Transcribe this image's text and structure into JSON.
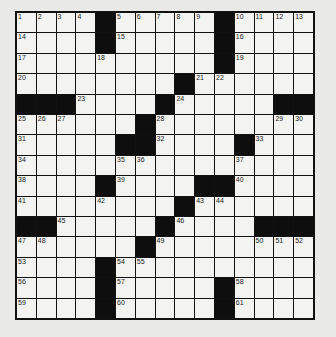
{
  "puzzle": {
    "rows": 15,
    "cols": 15,
    "grid": [
      "....#.....#....",
      "....#.....#....",
      "..........#....",
      "........#......",
      "###....#.....##",
      "......#......  ",
      ".....##....#...",
      "...............",
      "....#....##....",
      "........#......",
      "##.....#....###",
      "......#........",
      "....#..........",
      "....#.....#....",
      "....#.....#...."
    ],
    "numbers": [
      {
        "r": 0,
        "c": 0,
        "n": "1"
      },
      {
        "r": 0,
        "c": 1,
        "n": "2"
      },
      {
        "r": 0,
        "c": 2,
        "n": "3"
      },
      {
        "r": 0,
        "c": 3,
        "n": "4"
      },
      {
        "r": 0,
        "c": 5,
        "n": "5"
      },
      {
        "r": 0,
        "c": 6,
        "n": "6"
      },
      {
        "r": 0,
        "c": 7,
        "n": "7"
      },
      {
        "r": 0,
        "c": 8,
        "n": "8"
      },
      {
        "r": 0,
        "c": 9,
        "n": "9"
      },
      {
        "r": 0,
        "c": 11,
        "n": "10"
      },
      {
        "r": 0,
        "c": 12,
        "n": "11"
      },
      {
        "r": 0,
        "c": 13,
        "n": "12"
      },
      {
        "r": 0,
        "c": 14,
        "n": "13"
      },
      {
        "r": 1,
        "c": 0,
        "n": "14"
      },
      {
        "r": 1,
        "c": 5,
        "n": "15"
      },
      {
        "r": 1,
        "c": 11,
        "n": "16"
      },
      {
        "r": 2,
        "c": 0,
        "n": "17"
      },
      {
        "r": 2,
        "c": 4,
        "n": "18"
      },
      {
        "r": 2,
        "c": 11,
        "n": "19"
      },
      {
        "r": 3,
        "c": 0,
        "n": "20"
      },
      {
        "r": 3,
        "c": 9,
        "n": "21"
      },
      {
        "r": 3,
        "c": 10,
        "n": "22"
      },
      {
        "r": 4,
        "c": 3,
        "n": "23"
      },
      {
        "r": 4,
        "c": 8,
        "n": "24"
      },
      {
        "r": 5,
        "c": 0,
        "n": "25"
      },
      {
        "r": 5,
        "c": 1,
        "n": "26"
      },
      {
        "r": 5,
        "c": 2,
        "n": "27"
      },
      {
        "r": 5,
        "c": 7,
        "n": "28"
      },
      {
        "r": 5,
        "c": 13,
        "n": "29"
      },
      {
        "r": 5,
        "c": 14,
        "n": "30"
      },
      {
        "r": 6,
        "c": 0,
        "n": "31"
      },
      {
        "r": 6,
        "c": 7,
        "n": "32"
      },
      {
        "r": 6,
        "c": 12,
        "n": "33"
      },
      {
        "r": 7,
        "c": 0,
        "n": "34"
      },
      {
        "r": 7,
        "c": 5,
        "n": "35"
      },
      {
        "r": 7,
        "c": 6,
        "n": "36"
      },
      {
        "r": 7,
        "c": 11,
        "n": "37"
      },
      {
        "r": 8,
        "c": 0,
        "n": "38"
      },
      {
        "r": 8,
        "c": 5,
        "n": "39"
      },
      {
        "r": 8,
        "c": 11,
        "n": "40"
      },
      {
        "r": 9,
        "c": 0,
        "n": "41"
      },
      {
        "r": 9,
        "c": 4,
        "n": "42"
      },
      {
        "r": 9,
        "c": 9,
        "n": "43"
      },
      {
        "r": 9,
        "c": 10,
        "n": "44"
      },
      {
        "r": 10,
        "c": 2,
        "n": "45"
      },
      {
        "r": 10,
        "c": 8,
        "n": "46"
      },
      {
        "r": 11,
        "c": 0,
        "n": "47"
      },
      {
        "r": 11,
        "c": 1,
        "n": "48"
      },
      {
        "r": 11,
        "c": 7,
        "n": "49"
      },
      {
        "r": 11,
        "c": 12,
        "n": "50"
      },
      {
        "r": 11,
        "c": 13,
        "n": "51"
      },
      {
        "r": 11,
        "c": 14,
        "n": "52"
      },
      {
        "r": 12,
        "c": 0,
        "n": "53"
      },
      {
        "r": 12,
        "c": 5,
        "n": "54"
      },
      {
        "r": 12,
        "c": 6,
        "n": "55"
      },
      {
        "r": 13,
        "c": 0,
        "n": "56"
      },
      {
        "r": 13,
        "c": 5,
        "n": "57"
      },
      {
        "r": 13,
        "c": 11,
        "n": "58"
      },
      {
        "r": 14,
        "c": 0,
        "n": "59"
      },
      {
        "r": 14,
        "c": 5,
        "n": "60"
      },
      {
        "r": 14,
        "c": 11,
        "n": "61"
      }
    ]
  }
}
